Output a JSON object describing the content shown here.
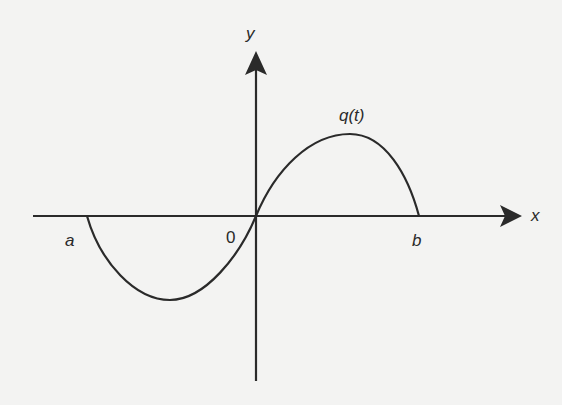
{
  "figure": {
    "labels": {
      "y_axis": "y",
      "x_axis": "x",
      "origin": "0",
      "left_root": "a",
      "right_root": "b",
      "curve": "q(t)"
    },
    "colors": {
      "background": "#f3f3f2",
      "ink": "#2a2a2a"
    },
    "geometry": {
      "origin_px": [
        256,
        216
      ],
      "x_axis_px": [
        33,
        522
      ],
      "y_axis_px": [
        51,
        381
      ],
      "root_a_px": 87,
      "root_b_px": 419,
      "trough_px": [
        170,
        300
      ],
      "peak_px": [
        350,
        134
      ]
    }
  }
}
